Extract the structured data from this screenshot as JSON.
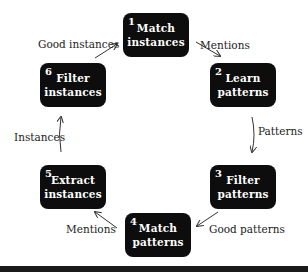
{
  "diagram": {
    "type": "cycle",
    "nodes": [
      {
        "id": 1,
        "number": "1",
        "line1": "Match",
        "line2": "instances"
      },
      {
        "id": 2,
        "number": "2",
        "line1": "Learn",
        "line2": "patterns"
      },
      {
        "id": 3,
        "number": "3",
        "line1": "Filter",
        "line2": "patterns"
      },
      {
        "id": 4,
        "number": "4",
        "line1": "Match",
        "line2": "patterns"
      },
      {
        "id": 5,
        "number": "5",
        "line1": "Extract",
        "line2": "instances"
      },
      {
        "id": 6,
        "number": "6",
        "line1": "Filter",
        "line2": "instances"
      }
    ],
    "edges": [
      {
        "from": 1,
        "to": 2,
        "label": "Mentions"
      },
      {
        "from": 2,
        "to": 3,
        "label": "Patterns"
      },
      {
        "from": 3,
        "to": 4,
        "label": "Good patterns"
      },
      {
        "from": 4,
        "to": 5,
        "label": "Mentions"
      },
      {
        "from": 5,
        "to": 6,
        "label": "Instances"
      },
      {
        "from": 6,
        "to": 1,
        "label": "Good instances"
      }
    ],
    "colors": {
      "box": "#0d0d0d",
      "box_text": "#ffffff",
      "arrow": "#333333",
      "label": "#222222"
    }
  }
}
